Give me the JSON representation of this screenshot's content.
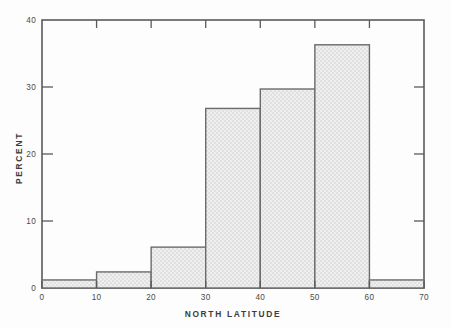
{
  "chart_data": {
    "type": "bar",
    "title": "",
    "subtitle": "",
    "xlabel": "NORTH LATITUDE",
    "ylabel": "PERCENT",
    "xlim": [
      0,
      70
    ],
    "ylim": [
      0,
      40
    ],
    "xticks": [
      0,
      10,
      20,
      30,
      40,
      50,
      60,
      70
    ],
    "yticks": [
      0,
      10,
      20,
      30,
      40
    ],
    "xtick_labels": [
      "0",
      "10",
      "20",
      "30",
      "40",
      "50",
      "60",
      "70"
    ],
    "ytick_labels": [
      "0",
      "10",
      "20",
      "30",
      "40"
    ],
    "grid": false,
    "legend": null,
    "bin_width": 10,
    "bin_edges": [
      0,
      10,
      20,
      30,
      40,
      50,
      60,
      70
    ],
    "categories": [
      "0-10",
      "10-20",
      "20-30",
      "30-40",
      "40-50",
      "50-60",
      "60-70"
    ],
    "values": [
      1.2,
      2.4,
      6.1,
      26.8,
      29.7,
      36.3,
      1.2
    ],
    "series": [
      {
        "name": "Percent by north latitude",
        "values": [
          1.2,
          2.4,
          6.1,
          26.8,
          29.7,
          36.3,
          1.2
        ]
      }
    ],
    "bar_fill_color": "#e8e8e8",
    "bar_edge_color": "#6b6b6b",
    "axis_color": "#5a5a5a",
    "background_color": "#fdfdfd",
    "annotations": []
  },
  "labels": {
    "x_axis_title": "NORTH LATITUDE",
    "y_axis_title": "PERCENT",
    "x0": "0",
    "x10": "10",
    "x20": "20",
    "x30": "30",
    "x40": "40",
    "x50": "50",
    "x60": "60",
    "x70": "70",
    "y0": "0",
    "y10": "10",
    "y20": "20",
    "y30": "30",
    "y40": "40"
  }
}
